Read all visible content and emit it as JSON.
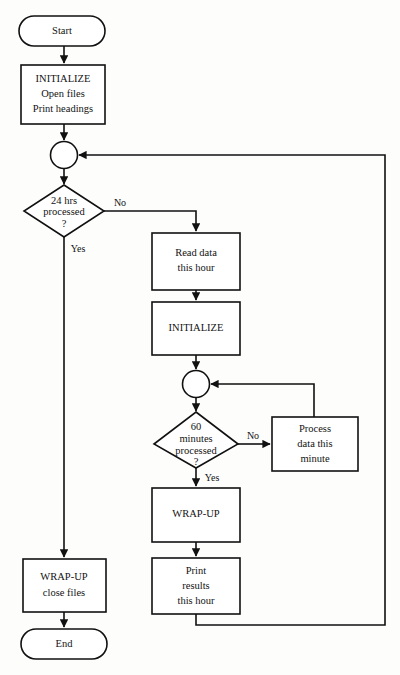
{
  "diagram": {
    "colors": {
      "background": "#fdfdfc",
      "stroke": "#111111",
      "fill": "#ffffff",
      "text": "#121212"
    },
    "nodes": {
      "start": {
        "label": "Start",
        "shape": "terminator"
      },
      "initialize_main": {
        "line1": "INITIALIZE",
        "line2": "Open files",
        "line3": "Print headings",
        "shape": "process"
      },
      "junction_outer": {
        "label": "",
        "shape": "connector-circle"
      },
      "decision_hours": {
        "line1": "24 hrs",
        "line2": "processed",
        "line3": "?",
        "shape": "decision"
      },
      "read_data": {
        "line1": "Read data",
        "line2": "this hour",
        "shape": "process"
      },
      "initialize_hour": {
        "line1": "INITIALIZE",
        "shape": "process"
      },
      "junction_inner": {
        "label": "",
        "shape": "connector-circle"
      },
      "decision_minutes": {
        "line1": "60",
        "line2": "minutes",
        "line3": "processed",
        "line4": "?",
        "shape": "decision"
      },
      "process_minute": {
        "line1": "Process",
        "line2": "data this",
        "line3": "minute",
        "shape": "process"
      },
      "wrapup_hour": {
        "line1": "WRAP-UP",
        "shape": "process"
      },
      "print_results": {
        "line1": "Print",
        "line2": "results",
        "line3": "this hour",
        "shape": "process"
      },
      "wrapup_close": {
        "line1": "WRAP-UP",
        "line2": "close files",
        "shape": "process"
      },
      "end": {
        "label": "End",
        "shape": "terminator"
      }
    },
    "edge_labels": {
      "hours_no": "No",
      "hours_yes": "Yes",
      "minutes_no": "No",
      "minutes_yes": "Yes"
    }
  }
}
